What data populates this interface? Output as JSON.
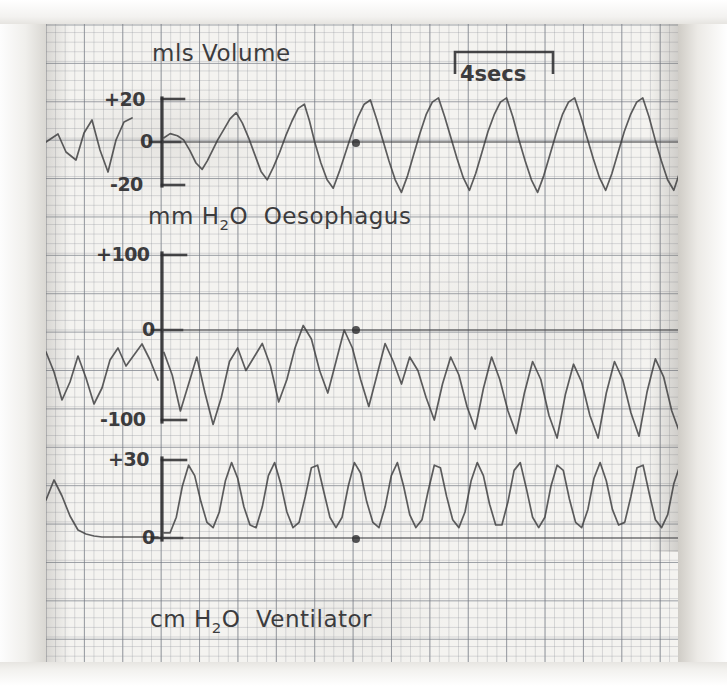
{
  "figure": {
    "kind": "physiological-chart-recording",
    "paper_color": "#f4f3f0",
    "trace_color": "#3b3b3c",
    "grid_color": "#464e5c"
  },
  "timebar": {
    "label": "4secs",
    "x_start_px": 455,
    "x_end_px": 553
  },
  "panels": [
    {
      "id": "volume",
      "title_prefix": "mls",
      "title_main": "Volume",
      "title_full": "mls Volume",
      "unit": "mls",
      "ticks": [
        "+20",
        "0",
        "-20"
      ],
      "tick_values": [
        20,
        0,
        -20
      ]
    },
    {
      "id": "oesophagus",
      "title_prefix": "mm",
      "title_sub_base": "H",
      "title_sub": "2",
      "title_sub_tail": "O",
      "title_main": "Oesophagus",
      "title_full": "mm H2O Oesophagus",
      "unit": "mm H2O",
      "ticks": [
        "+100",
        "0",
        "-100"
      ],
      "tick_values": [
        100,
        0,
        -100
      ]
    },
    {
      "id": "ventilator",
      "title_prefix": "cm",
      "title_sub_base": "H",
      "title_sub": "2",
      "title_sub_tail": "O",
      "title_main": "Ventilator",
      "title_full": "cm H2O Ventilator",
      "unit": "cm H2O",
      "ticks": [
        "+30",
        "0"
      ],
      "tick_values": [
        30,
        0
      ]
    }
  ],
  "chart_data": {
    "type": "line",
    "xlabel": "time",
    "time_scale_bar_seconds": 4,
    "time_scale_bar_px": 98,
    "grid": true,
    "legend": "none",
    "series": [
      {
        "name": "mls Volume",
        "ylabel": "mls Volume",
        "ytick_labels": [
          "+20",
          "0",
          "-20"
        ],
        "ylim": [
          -30,
          28
        ],
        "waveform": "sawtooth",
        "note": "slow ramp up then sharp fall; ~19 breaths across trace",
        "x": [
          0,
          6,
          13,
          19,
          25,
          31,
          37,
          42,
          47,
          52,
          58,
          64,
          70,
          76,
          82,
          88,
          94,
          100,
          106,
          112,
          118,
          124,
          130,
          136,
          141,
          146,
          152,
          158,
          164,
          170,
          176,
          182,
          188,
          194,
          200,
          206,
          212,
          218,
          224,
          230,
          236,
          242,
          248,
          254,
          260,
          266,
          272,
          278,
          284,
          290,
          296,
          302,
          308,
          314,
          320,
          326,
          332,
          338,
          344,
          350,
          356,
          362,
          368,
          374,
          380,
          386,
          392,
          398,
          404,
          410,
          416,
          422,
          428,
          434,
          440,
          446,
          452,
          458,
          464,
          470,
          476,
          482,
          488,
          494,
          500
        ],
        "y": [
          2,
          4,
          3,
          1,
          -4,
          -10,
          -13,
          -9,
          -4,
          1,
          6,
          11,
          14,
          9,
          2,
          -6,
          -14,
          -18,
          -12,
          -5,
          3,
          10,
          16,
          18,
          10,
          0,
          -10,
          -18,
          -22,
          -14,
          -5,
          4,
          12,
          18,
          20,
          11,
          1,
          -9,
          -18,
          -24,
          -16,
          -6,
          4,
          13,
          19,
          21,
          12,
          2,
          -8,
          -17,
          -23,
          -15,
          -5,
          5,
          13,
          19,
          21,
          12,
          1,
          -9,
          -18,
          -24,
          -16,
          -6,
          4,
          13,
          19,
          21,
          12,
          2,
          -8,
          -17,
          -23,
          -15,
          -5,
          5,
          13,
          19,
          21,
          12,
          1,
          -9,
          -18,
          -23,
          -14
        ]
      },
      {
        "name": "mm H2O Oesophagus",
        "ylabel": "mm H2O Oesophagus",
        "ytick_labels": [
          "+100",
          "0",
          "-100"
        ],
        "ylim": [
          -130,
          110
        ],
        "waveform": "irregular-then-regular oscillation",
        "note": "large irregular negative swings early, settling to regular oscillation around -40",
        "x": [
          0,
          8,
          16,
          24,
          32,
          40,
          48,
          56,
          64,
          72,
          80,
          88,
          96,
          104,
          112,
          120,
          128,
          136,
          144,
          152,
          160,
          168,
          176,
          184,
          192,
          200,
          208,
          216,
          224,
          232,
          240,
          248,
          256,
          264,
          272,
          280,
          288,
          296,
          304,
          312,
          320,
          328,
          336,
          344,
          352,
          360,
          368,
          376,
          384,
          392,
          400,
          408,
          416,
          424,
          432,
          440,
          448,
          456,
          464,
          472,
          480,
          488,
          496,
          504
        ],
        "y": [
          -25,
          -50,
          -90,
          -60,
          -30,
          -70,
          -105,
          -75,
          -35,
          -20,
          -45,
          -30,
          -15,
          -40,
          -80,
          -55,
          -20,
          5,
          -10,
          -45,
          -70,
          -35,
          0,
          -20,
          -55,
          -85,
          -50,
          -15,
          -35,
          -60,
          -30,
          -45,
          -75,
          -100,
          -60,
          -30,
          -50,
          -85,
          -110,
          -65,
          -30,
          -55,
          -90,
          -115,
          -70,
          -35,
          -55,
          -95,
          -120,
          -72,
          -38,
          -58,
          -95,
          -120,
          -70,
          -35,
          -55,
          -92,
          -118,
          -68,
          -32,
          -52,
          -90,
          -115
        ]
      },
      {
        "name": "cm H2O Ventilator",
        "ylabel": "cm H2O Ventilator",
        "ytick_labels": [
          "+30",
          "0"
        ],
        "ylim": [
          -2,
          36
        ],
        "waveform": "triangular",
        "note": "regular triangular ventilator pressure cycles between ~4 and ~28 cm H2O",
        "x": [
          0,
          6,
          12,
          18,
          24,
          30,
          36,
          42,
          48,
          54,
          60,
          66,
          72,
          78,
          84,
          90,
          96,
          102,
          108,
          114,
          120,
          126,
          132,
          138,
          144,
          150,
          156,
          162,
          168,
          174,
          180,
          186,
          192,
          198,
          204,
          210,
          216,
          222,
          228,
          234,
          240,
          246,
          252,
          258,
          264,
          270,
          276,
          282,
          288,
          294,
          300,
          306,
          312,
          318,
          324,
          330,
          336,
          342,
          348,
          354,
          360,
          366,
          372,
          378,
          384,
          390,
          396,
          402,
          408,
          414,
          420,
          426,
          432,
          438,
          444,
          450,
          456,
          462,
          468,
          474,
          480,
          486,
          492,
          498,
          504
        ],
        "y": [
          2,
          2,
          8,
          20,
          28,
          24,
          14,
          6,
          4,
          10,
          22,
          29,
          23,
          12,
          5,
          4,
          12,
          24,
          29,
          21,
          10,
          4,
          6,
          16,
          27,
          28,
          18,
          8,
          4,
          8,
          20,
          29,
          25,
          14,
          6,
          4,
          12,
          24,
          29,
          20,
          9,
          4,
          7,
          18,
          28,
          27,
          16,
          7,
          4,
          10,
          22,
          29,
          24,
          13,
          5,
          5,
          14,
          26,
          29,
          19,
          8,
          4,
          8,
          20,
          28,
          26,
          15,
          6,
          4,
          11,
          23,
          29,
          22,
          11,
          5,
          6,
          16,
          27,
          28,
          17,
          7,
          4,
          9,
          21,
          28
        ]
      }
    ]
  }
}
